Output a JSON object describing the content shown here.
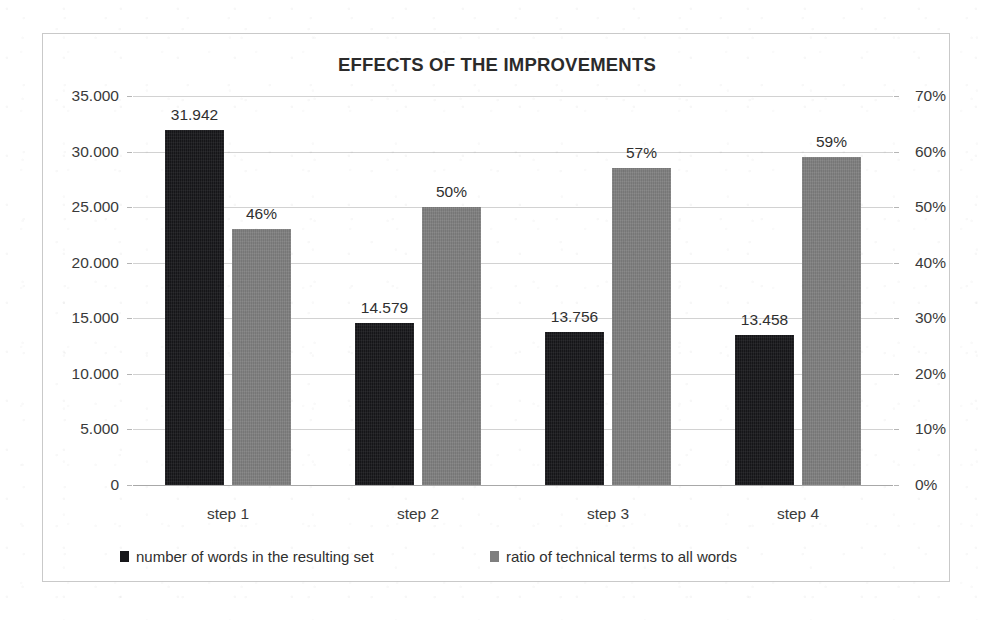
{
  "chart_data": {
    "type": "bar",
    "title": "EFFECTS OF THE IMPROVEMENTS",
    "categories": [
      "step 1",
      "step 2",
      "step 3",
      "step 4"
    ],
    "series": [
      {
        "name": "number of words in the resulting set",
        "axis": "left",
        "color": "#17171a",
        "values": [
          31942,
          14579,
          13756,
          13458
        ],
        "data_labels": [
          "31.942",
          "14.579",
          "13.756",
          "13.458"
        ]
      },
      {
        "name": "ratio of technical terms to all words",
        "axis": "right",
        "color": "#7f7f7f",
        "values": [
          46,
          50,
          57,
          59
        ],
        "data_labels": [
          "46%",
          "50%",
          "57%",
          "59%"
        ]
      }
    ],
    "xlabel": "",
    "ylabel": "",
    "ylim": [
      0,
      35000
    ],
    "y2lim": [
      0,
      70
    ],
    "left_axis_ticks": [
      "0",
      "5.000",
      "10.000",
      "15.000",
      "20.000",
      "25.000",
      "30.000",
      "35.000"
    ],
    "left_axis_values": [
      0,
      5000,
      10000,
      15000,
      20000,
      25000,
      30000,
      35000
    ],
    "right_axis_ticks": [
      "0%",
      "10%",
      "20%",
      "30%",
      "40%",
      "50%",
      "60%",
      "70%"
    ],
    "right_axis_values": [
      0,
      10,
      20,
      30,
      40,
      50,
      60,
      70
    ],
    "grid": true,
    "legend_position": "bottom"
  },
  "legend": [
    {
      "label": "number of words in the resulting set",
      "swatch": "words"
    },
    {
      "label": "ratio of technical terms to all words",
      "swatch": "ratio"
    }
  ]
}
